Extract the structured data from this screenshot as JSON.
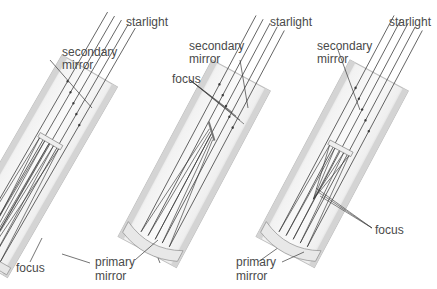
{
  "diagram": {
    "telescopes": [
      {
        "id": "left",
        "labels": {
          "starlight": "starlight",
          "secondary_line1": "secondary",
          "secondary_line2": "mirror",
          "focus": "focus",
          "primary_line1": "primary",
          "primary_line2": "mirror"
        }
      },
      {
        "id": "middle",
        "labels": {
          "starlight": "starlight",
          "secondary_line1": "secondary",
          "secondary_line2": "mirror",
          "focus": "focus",
          "primary_line1": "primary",
          "primary_line2": "mirror"
        }
      },
      {
        "id": "right",
        "labels": {
          "starlight": "starlight",
          "secondary_line1": "secondary",
          "secondary_line2": "mirror",
          "focus": "focus",
          "primary_line1": "primary",
          "primary_line2": "mirror"
        }
      }
    ],
    "colors": {
      "tube": "#d9d9d9",
      "tube_edge": "#b8b8b8",
      "ray": "#3a3a3a",
      "label": "#4a4a4a"
    }
  }
}
